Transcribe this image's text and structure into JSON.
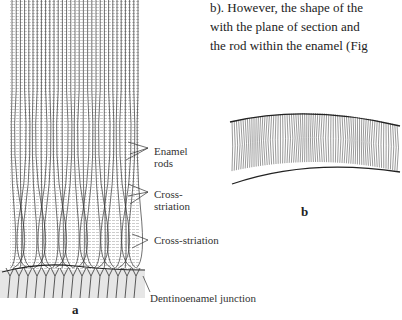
{
  "text": {
    "lines": [
      "b). However, the shape of the",
      "with the plane of section and",
      "the rod within the enamel (Fig"
    ],
    "partial_top_line": "…of the enamel or of dentin ray"
  },
  "figure_a": {
    "labels": {
      "enamel_rods": "Enamel rods",
      "enamel_rods_l1": "Enamel",
      "enamel_rods_l2": "rods",
      "cross1_l1": "Cross-",
      "cross1_l2": "striation",
      "cross2": "Cross-striation",
      "dej": "Dentinoenamel  junction"
    },
    "caption": "a"
  },
  "figure_b": {
    "caption": "b"
  }
}
